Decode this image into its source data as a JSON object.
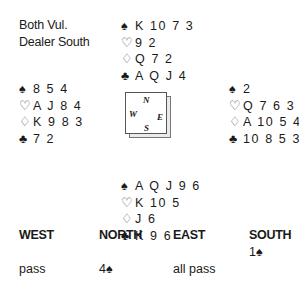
{
  "info": {
    "vulnerability": "Both Vul.",
    "dealer": "Dealer South"
  },
  "hands": {
    "north": {
      "spades": "K 10 7 3",
      "hearts": "9 2",
      "diamonds": "Q 7 2",
      "clubs": "A Q J 4"
    },
    "west": {
      "spades": "8 5 4",
      "hearts": "A J 8 4",
      "diamonds": "K 9 8 3",
      "clubs": "7 2"
    },
    "east": {
      "spades": "2",
      "hearts": "Q 7 6 3",
      "diamonds": "A 10 5 4",
      "clubs": "10 8 5 3"
    },
    "south": {
      "spades": "A Q J 9 6",
      "hearts": "K 10 5",
      "diamonds": "J 6",
      "clubs": "K 9 6"
    }
  },
  "suit_symbols": {
    "spades": "♠",
    "hearts": "♡",
    "diamonds": "♢",
    "clubs": "♣"
  },
  "compass": {
    "n": "N",
    "w": "W",
    "e": "E",
    "s": "S"
  },
  "bidding": {
    "headers": [
      "WEST",
      "NORTH",
      "EAST",
      "SOUTH"
    ],
    "rounds": [
      [
        "",
        "",
        "",
        "1♠"
      ],
      [
        "pass",
        "4♠",
        "all pass",
        ""
      ]
    ]
  }
}
